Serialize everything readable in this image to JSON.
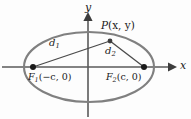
{
  "figure": {
    "kind": "ellipse-focal-definition-diagram",
    "background_color": "#fdfdfd",
    "curve_color": "#808080",
    "axis_color": "#5a5a5a",
    "segment_color": "#4a4a4a",
    "text_color": "#1a1a1a",
    "axes": {
      "x_label": "x",
      "y_label": "y",
      "origin": {
        "x": 88,
        "y": 67
      }
    },
    "ellipse": {
      "center_x": 89,
      "center_y": 67,
      "semi_major_axis_px": 65,
      "semi_minor_axis_px": 35,
      "stroke_width": 2.1
    },
    "points": [
      {
        "name": "left-focus",
        "label_main": "F",
        "label_sub": "1",
        "label_coords": "(−c, 0)",
        "label_text": "F₁(−c, 0)",
        "x": 33,
        "y": 67,
        "dot_radius": 3.0
      },
      {
        "name": "right-focus",
        "label_main": "F",
        "label_sub": "2",
        "label_coords": "(c, 0)",
        "label_text": "F₂(c, 0)",
        "x": 144,
        "y": 67,
        "dot_radius": 3.0
      },
      {
        "name": "point-p",
        "label_main": "P",
        "label_coords": "(x, y)",
        "label_text": "P(x, y)",
        "x": 110,
        "y": 41,
        "dot_radius": 2.4
      }
    ],
    "segments": [
      {
        "name": "d1",
        "label_main": "d",
        "label_sub": "1",
        "label_text": "d₁",
        "from": "left-focus",
        "to": "point-p",
        "x1": 33,
        "y1": 67,
        "x2": 110,
        "y2": 41,
        "label_x": 52,
        "label_y": 44
      },
      {
        "name": "d2",
        "label_main": "d",
        "label_sub": "2",
        "label_text": "d₂",
        "from": "point-p",
        "to": "right-focus",
        "x1": 110,
        "y1": 41,
        "x2": 144,
        "y2": 67,
        "label_x": 108,
        "label_y": 52
      }
    ]
  }
}
